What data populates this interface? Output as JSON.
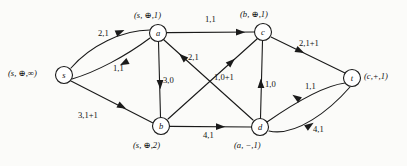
{
  "diagram": {
    "type": "directed-graph",
    "colors": {
      "stroke": "#1a1a1a",
      "background": "#fbfbf9",
      "node_fill": "#ffffff"
    },
    "nodes": [
      {
        "id": "s",
        "name": "s",
        "cx": 64,
        "cy": 75,
        "r": 8.5,
        "tag": "(s, ⊕,∞)",
        "tag_x": 8,
        "tag_y": 68,
        "tag_align": "left"
      },
      {
        "id": "a",
        "name": "a",
        "cx": 158,
        "cy": 33,
        "r": 8.5,
        "tag": "(s, ⊕,1)",
        "tag_x": 134,
        "tag_y": 10,
        "tag_align": "left"
      },
      {
        "id": "c",
        "name": "c",
        "cx": 263,
        "cy": 32,
        "r": 8.5,
        "tag": "(b, ⊕,1)",
        "tag_x": 240,
        "tag_y": 9,
        "tag_align": "left"
      },
      {
        "id": "t",
        "name": "t",
        "cx": 352,
        "cy": 78,
        "r": 8.5,
        "tag": "(c,+,1)",
        "tag_x": 364,
        "tag_y": 71,
        "tag_align": "left"
      },
      {
        "id": "b",
        "name": "b",
        "cx": 161,
        "cy": 126,
        "r": 8.5,
        "tag": "(s, ⊕,2)",
        "tag_x": 133,
        "tag_y": 140,
        "tag_align": "left"
      },
      {
        "id": "d",
        "name": "d",
        "cx": 260,
        "cy": 127,
        "r": 8.5,
        "tag": "(a, −,1)",
        "tag_x": 234,
        "tag_y": 140,
        "tag_align": "left"
      }
    ],
    "edges": [
      {
        "id": "s-a-upper",
        "from": "s",
        "to": "a",
        "label": "2,1",
        "label_x": 98,
        "label_y": 28,
        "curve": "up"
      },
      {
        "id": "a-s-lower",
        "from": "a",
        "to": "s",
        "label": "1,1",
        "label_x": 113,
        "label_y": 63,
        "curve": "down"
      },
      {
        "id": "s-b",
        "from": "s",
        "to": "b",
        "label": "3,1+1",
        "label_x": 78,
        "label_y": 110,
        "curve": "straight"
      },
      {
        "id": "a-b",
        "from": "a",
        "to": "b",
        "label": "3,0",
        "label_x": 163,
        "label_y": 75,
        "curve": "straight"
      },
      {
        "id": "a-c",
        "from": "a",
        "to": "c",
        "label": "1,1",
        "label_x": 205,
        "label_y": 14,
        "curve": "straight"
      },
      {
        "id": "d-a",
        "from": "d",
        "to": "a",
        "label": "2,1",
        "label_x": 188,
        "label_y": 52,
        "curve": "straight"
      },
      {
        "id": "b-c",
        "from": "b",
        "to": "c",
        "label": "1,0+1",
        "label_x": 214,
        "label_y": 72,
        "curve": "straight"
      },
      {
        "id": "d-c",
        "from": "d",
        "to": "c",
        "label": "1,0",
        "label_x": 265,
        "label_y": 79,
        "curve": "straight"
      },
      {
        "id": "c-t",
        "from": "c",
        "to": "t",
        "label": "2,1+1",
        "label_x": 299,
        "label_y": 38,
        "curve": "straight"
      },
      {
        "id": "b-d",
        "from": "b",
        "to": "d",
        "label": "4,1",
        "label_x": 203,
        "label_y": 130,
        "curve": "straight"
      },
      {
        "id": "t-d",
        "from": "t",
        "to": "d",
        "label": "1,1",
        "label_x": 305,
        "label_y": 81,
        "curve": "up"
      },
      {
        "id": "d-t",
        "from": "d",
        "to": "t",
        "label": "4,1",
        "label_x": 313,
        "label_y": 124,
        "curve": "down"
      }
    ]
  }
}
